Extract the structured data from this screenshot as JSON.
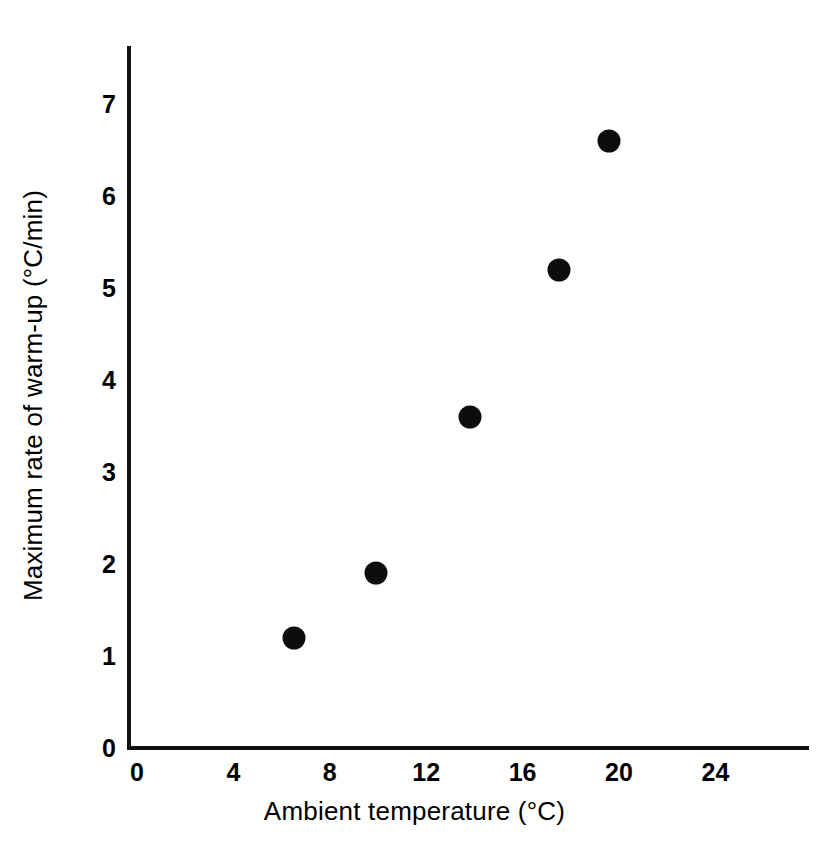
{
  "chart_data": {
    "type": "scatter",
    "title": "",
    "subtitle": "",
    "xlabel": "Ambient temperature (°C)",
    "ylabel": "Maximum rate of warm-up (°C/min)",
    "xlim": [
      0,
      28
    ],
    "ylim": [
      0,
      7.3
    ],
    "xticks": [
      0,
      4,
      8,
      12,
      16,
      20,
      24
    ],
    "yticks": [
      0,
      1,
      2,
      3,
      4,
      5,
      6,
      7
    ],
    "xtick_labels": [
      "0",
      "4",
      "8",
      "12",
      "16",
      "20",
      "24"
    ],
    "ytick_labels": [
      "0",
      "1",
      "2",
      "3",
      "4",
      "5",
      "6",
      "7"
    ],
    "grid": false,
    "legend": false,
    "legend_position": "none",
    "marker_style": "filled-circle",
    "marker_color": "#0d0d0d",
    "axis_color": "#111111",
    "background_color": "#ffffff",
    "points": [
      {
        "x": 6.5,
        "y": 1.2
      },
      {
        "x": 9.9,
        "y": 1.9
      },
      {
        "x": 13.8,
        "y": 3.6
      },
      {
        "x": 17.5,
        "y": 5.2
      },
      {
        "x": 19.6,
        "y": 6.6
      }
    ],
    "series": [
      {
        "name": "Maximum rate of warm-up",
        "x": [
          6.5,
          9.9,
          13.8,
          17.5,
          19.6
        ],
        "values": [
          1.2,
          1.9,
          3.6,
          5.2,
          6.6
        ]
      }
    ],
    "annotations": []
  },
  "geometry": {
    "x_origin_px": 137,
    "y_origin_px": 748,
    "px_per_x_unit": 24.1,
    "px_per_y_unit": 92,
    "marker_diameter_px": 23
  }
}
